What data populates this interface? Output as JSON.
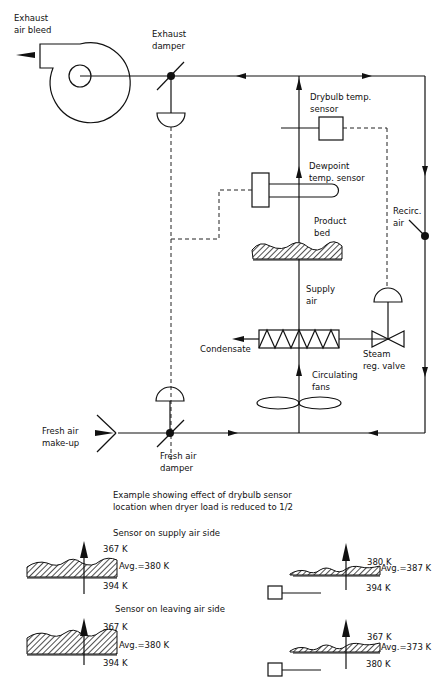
{
  "labels": {
    "exhaust_air_bleed": [
      "Exhaust",
      "air bleed"
    ],
    "exhaust_damper": [
      "Exhaust",
      "damper"
    ],
    "drybulb_sensor": [
      "Drybulb temp.",
      "sensor"
    ],
    "dewpoint_sensor": [
      "Dewpoint",
      "temp. sensor"
    ],
    "recirc_air": [
      "Recirc.",
      "air"
    ],
    "product_bed": [
      "Product",
      "bed"
    ],
    "supply_air": [
      "Supply",
      "air"
    ],
    "condensate": "Condensate",
    "steam_valve": [
      "Steam",
      "reg. valve"
    ],
    "circulating_fans": [
      "Circulating",
      "fans"
    ],
    "fresh_air_makeup": [
      "Fresh air",
      "make-up"
    ],
    "fresh_air_damper": [
      "Fresh air",
      "damper"
    ]
  },
  "example": {
    "title": [
      "Example showing effect of drybulb sensor",
      "location when dryer load is reduced to 1/2"
    ],
    "supply_side": {
      "heading": "Sensor on supply air side",
      "full_load": {
        "top": "367 K",
        "avg": "Avg.=380 K",
        "bottom": "394 K"
      },
      "half_load": {
        "top": "380 K",
        "avg": "Avg.=387 K",
        "bottom": "394 K"
      }
    },
    "leaving_side": {
      "heading": "Sensor on leaving air side",
      "full_load": {
        "top": "367 K",
        "avg": "Avg.=380 K",
        "bottom": "394 K"
      },
      "half_load": {
        "top": "367 K",
        "avg": "Avg.=373 K",
        "bottom": "380 K"
      }
    }
  }
}
